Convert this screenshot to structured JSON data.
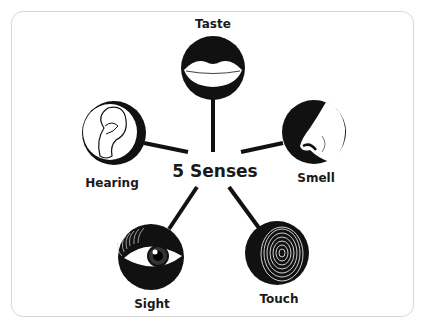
{
  "diagram": {
    "center_title": "5 Senses",
    "senses": [
      {
        "id": "taste",
        "label": "Taste",
        "icon": "lips-icon"
      },
      {
        "id": "hearing",
        "label": "Hearing",
        "icon": "ear-icon"
      },
      {
        "id": "smell",
        "label": "Smell",
        "icon": "nose-icon"
      },
      {
        "id": "sight",
        "label": "Sight",
        "icon": "eye-icon"
      },
      {
        "id": "touch",
        "label": "Touch",
        "icon": "fingerprint-icon"
      }
    ],
    "colors": {
      "ink": "#111111",
      "background": "#ffffff",
      "frame_border": "#d8d8d8"
    }
  }
}
